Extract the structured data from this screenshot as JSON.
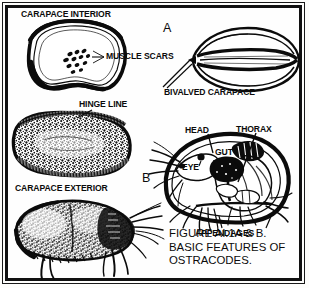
{
  "figure": {
    "panel_letters": [
      {
        "name": "panel-letter-a",
        "text": "A"
      },
      {
        "name": "panel-letter-b",
        "text": "B"
      }
    ],
    "labels": {
      "carapace_interior": "CARAPACE INTERIOR",
      "muscle_scars": "MUSCLE SCARS",
      "hinge_line": "HINGE LINE",
      "carapace_exterior": "CARAPACE EXTERIOR",
      "bivalved_carapace": "BIVALVED CARAPACE",
      "head": "HEAD",
      "thorax": "THORAX",
      "eye": "EYE",
      "gut": "GUT",
      "appendages": "APPENDAGES"
    },
    "caption": {
      "line1": "FIGURE AI.1A & B.",
      "line2": "BASIC FEATURES OF",
      "line3": "OSTRACODES."
    },
    "colors": {
      "ink": "#0b0b0b",
      "paper": "#fefefe",
      "frame": "#111111"
    },
    "specimens": [
      {
        "name": "carapace-interior-valve",
        "panel": "A",
        "description": "interior view of single valve with muscle scars and hinge line"
      },
      {
        "name": "carapace-exterior-valve",
        "panel": "A",
        "description": "stippled exterior view of single valve"
      },
      {
        "name": "carapace-exterior-whole",
        "panel": "A",
        "description": "stippled whole ostracode exterior with appendages"
      },
      {
        "name": "bivalved-carapace",
        "panel": "A",
        "description": "end view of closed bivalved carapace"
      },
      {
        "name": "ostracode-soft-anatomy",
        "panel": "B",
        "description": "soft body anatomy inside carapace showing head, eye, gut, thorax, appendages"
      }
    ]
  }
}
